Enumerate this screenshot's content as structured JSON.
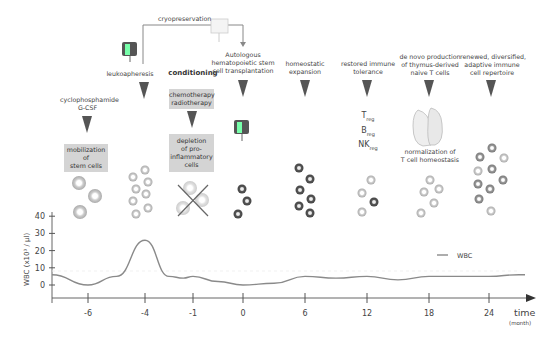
{
  "steps": {
    "cryopreservation": "cryopreservation",
    "leukapheresis": "leukoapheresis",
    "conditioning": "conditioning",
    "transplant": [
      "Autologous",
      "hematopoietic stem",
      "cell transplantation"
    ],
    "mobilization_drugs": [
      "cyclophosphamide",
      "G-CSF"
    ],
    "mobilization": [
      "mobilization of",
      "stem cells"
    ],
    "chemo": [
      "chemotherapy",
      "radiotherapy"
    ],
    "depletion": [
      "depletion",
      "of pro-",
      "inflammatory",
      "cells"
    ],
    "homeostatic": [
      "homeostatic",
      "expansion"
    ],
    "tolerance": [
      "restored immune",
      "tolerance"
    ],
    "treg": {
      "T": "T",
      "B": "B",
      "NK": "NK",
      "sub": "reg"
    },
    "denovo": [
      "de novo production",
      "of thymus-derived",
      "naive T cells"
    ],
    "normalization": [
      "normalization of",
      "T cell homeostasis"
    ],
    "renewed": [
      "renewed, diversified,",
      "adaptive immune",
      "cell repertoire"
    ]
  },
  "chart_data": {
    "type": "line",
    "title": "",
    "ylabel": "WBC (x10³ / µl)",
    "xlabel": "time",
    "xlabel_unit": "(month)",
    "x_ticks": [
      "-6",
      "-4",
      "-1",
      "0",
      "6",
      "12",
      "18",
      "24"
    ],
    "y_ticks": [
      "0",
      "10",
      "20",
      "30",
      "40"
    ],
    "ylim": [
      -8,
      42
    ],
    "legend": {
      "entries": [
        "WBC"
      ],
      "placement": "right"
    },
    "grid": false,
    "series": [
      {
        "name": "WBC",
        "color": "#888888",
        "tick_index_x": [
          -0.8,
          0,
          0.5,
          1,
          1.5,
          1.8,
          2,
          2.5,
          3,
          3.5,
          4,
          4.5,
          5,
          5.5,
          6,
          6.5,
          7,
          7.5,
          7.6
        ],
        "values": [
          6,
          0,
          5,
          26,
          5,
          4,
          5,
          2,
          0,
          1,
          5,
          4,
          5,
          3,
          5,
          5,
          5,
          6,
          6
        ]
      }
    ]
  }
}
